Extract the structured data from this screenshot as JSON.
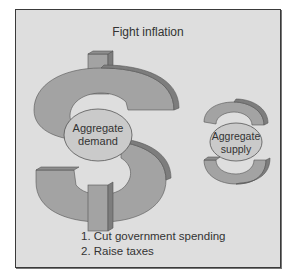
{
  "diagram": {
    "title": "Fight inflation",
    "shapes": [
      {
        "symbol": "dollar-sign",
        "label_line1": "Aggregate",
        "label_line2": "demand",
        "size": "large"
      },
      {
        "symbol": "s-shape",
        "label_line1": "Aggregate",
        "label_line2": "supply",
        "size": "small"
      }
    ],
    "steps": [
      "1. Cut government spending",
      "2. Raise taxes"
    ],
    "colors": {
      "background": "#dedede",
      "symbol_face": "#a3a3a3",
      "symbol_side": "#7d7d7d",
      "ellipse": "#cacaca",
      "border": "#3a3a3a"
    }
  }
}
